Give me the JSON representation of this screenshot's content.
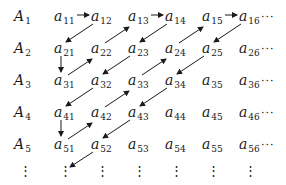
{
  "diagram": {
    "row_labels": [
      {
        "base": "A",
        "sub": "1"
      },
      {
        "base": "A",
        "sub": "2"
      },
      {
        "base": "A",
        "sub": "3"
      },
      {
        "base": "A",
        "sub": "4"
      },
      {
        "base": "A",
        "sub": "5"
      }
    ],
    "rows": [
      [
        {
          "base": "a",
          "sub": "11"
        },
        {
          "base": "a",
          "sub": "12"
        },
        {
          "base": "a",
          "sub": "13"
        },
        {
          "base": "a",
          "sub": "14"
        },
        {
          "base": "a",
          "sub": "15"
        },
        {
          "base": "a",
          "sub": "16"
        }
      ],
      [
        {
          "base": "a",
          "sub": "21"
        },
        {
          "base": "a",
          "sub": "22"
        },
        {
          "base": "a",
          "sub": "23"
        },
        {
          "base": "a",
          "sub": "24"
        },
        {
          "base": "a",
          "sub": "25"
        },
        {
          "base": "a",
          "sub": "26"
        }
      ],
      [
        {
          "base": "a",
          "sub": "31"
        },
        {
          "base": "a",
          "sub": "32"
        },
        {
          "base": "a",
          "sub": "33"
        },
        {
          "base": "a",
          "sub": "34"
        },
        {
          "base": "a",
          "sub": "35"
        },
        {
          "base": "a",
          "sub": "36"
        }
      ],
      [
        {
          "base": "a",
          "sub": "41"
        },
        {
          "base": "a",
          "sub": "42"
        },
        {
          "base": "a",
          "sub": "43"
        },
        {
          "base": "a",
          "sub": "44"
        },
        {
          "base": "a",
          "sub": "45"
        },
        {
          "base": "a",
          "sub": "46"
        }
      ],
      [
        {
          "base": "a",
          "sub": "51"
        },
        {
          "base": "a",
          "sub": "52"
        },
        {
          "base": "a",
          "sub": "53"
        },
        {
          "base": "a",
          "sub": "54"
        },
        {
          "base": "a",
          "sub": "55"
        },
        {
          "base": "a",
          "sub": "56"
        }
      ]
    ],
    "row_continuation": "···",
    "column_continuation": "⋮",
    "path_order": [
      "a11",
      "a12",
      "a21",
      "a31",
      "a22",
      "a13",
      "a14",
      "a23",
      "a32",
      "a41",
      "a51",
      "a42",
      "a33",
      "a24",
      "a15",
      "a16",
      "a25",
      "a34",
      "a43",
      "a52",
      "…"
    ],
    "arrow_color": "#1a1a1a"
  }
}
